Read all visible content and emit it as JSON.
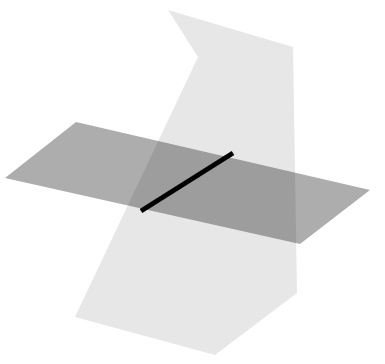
{
  "figure": {
    "canvas": {
      "width": 385,
      "height": 364,
      "background": "#ffffff"
    }
  },
  "colors": {
    "plane_light": "#e7e7e7",
    "plane_gray": "#adadad",
    "overlap_dark": "#9e9e9e",
    "overlap_mid": "#c9c9c9",
    "intersection_line": "#000000",
    "background": "#ffffff"
  },
  "chart_data": {
    "type": "diagram",
    "shapes": [
      {
        "name": "plane-gray",
        "label": "Gray plane",
        "fill": "#adadad",
        "points": [
          [
            5,
            178
          ],
          [
            76,
            122
          ],
          [
            370,
            190
          ],
          [
            300,
            244
          ]
        ]
      },
      {
        "name": "plane-light",
        "label": "Light plane",
        "fill": "#e7e7e7",
        "points": [
          [
            168,
            10
          ],
          [
            293,
            47
          ],
          [
            297,
            293
          ],
          [
            215,
            355
          ],
          [
            75,
            317
          ],
          [
            198,
            57
          ]
        ]
      }
    ],
    "lines": [
      {
        "name": "intersection-line",
        "label": "Line of intersection",
        "from": [
          141,
          211
        ],
        "to": [
          233,
          153
        ],
        "color": "#000000",
        "width": 5
      }
    ],
    "annotations": []
  },
  "geometry": {
    "plane_light_points": "168,10 293,47 297,293 215,355 75,317 198,57",
    "plane_gray_points": "5,178 76,122 370,190 300,244",
    "line_x1": 141,
    "line_y1": 211,
    "line_x2": 233,
    "line_y2": 153,
    "line_width": 5
  }
}
